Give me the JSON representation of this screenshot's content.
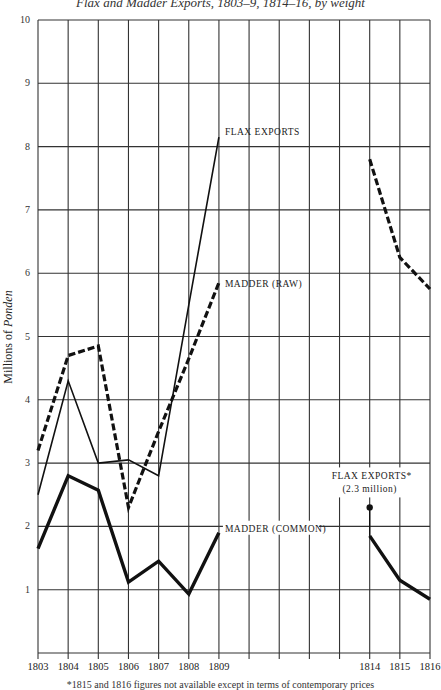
{
  "title": "Flax and Madder Exports, 1803–9, 1814–16, by weight",
  "footnote": "*1815 and 1816 figures not available except in terms of contemporary prices",
  "chart_data": {
    "type": "line",
    "title": "Flax and Madder Exports, 1803–9, 1814–16, by weight",
    "xlabel": "",
    "ylabel": "Millions of Ponden",
    "ylim": [
      0,
      10
    ],
    "yticks": [
      1,
      2,
      3,
      4,
      5,
      6,
      7,
      8,
      9,
      10
    ],
    "grid": true,
    "columns": [
      "1803",
      "1804",
      "1805",
      "1806",
      "1807",
      "1808",
      "1809",
      "",
      "",
      "",
      "",
      "1814",
      "1815",
      "1816"
    ],
    "x_labels": [
      "1803",
      "1804",
      "1805",
      "1806",
      "1807",
      "1808",
      "1809",
      "1814",
      "1815",
      "1816"
    ],
    "series": [
      {
        "name": "FLAX EXPORTS",
        "style": "thin-solid",
        "points": [
          {
            "x": "1803",
            "y": 2.5
          },
          {
            "x": "1804",
            "y": 4.3
          },
          {
            "x": "1805",
            "y": 3.0
          },
          {
            "x": "1806",
            "y": 3.05
          },
          {
            "x": "1807",
            "y": 2.8
          },
          {
            "x": "1808",
            "y": 5.5
          },
          {
            "x": "1809",
            "y": 8.15
          }
        ]
      },
      {
        "name": "MADDER (RAW)",
        "style": "thick-dashed",
        "points": [
          {
            "x": "1803",
            "y": 3.2
          },
          {
            "x": "1804",
            "y": 4.7
          },
          {
            "x": "1805",
            "y": 4.85
          },
          {
            "x": "1806",
            "y": 2.3
          },
          {
            "x": "1807",
            "y": 3.5
          },
          {
            "x": "1808",
            "y": 4.65
          },
          {
            "x": "1809",
            "y": 5.85
          },
          {
            "x": "1814",
            "y": 7.8,
            "break_before": true
          },
          {
            "x": "1815",
            "y": 6.25
          },
          {
            "x": "1816",
            "y": 5.75
          }
        ]
      },
      {
        "name": "MADDER (COMMON)",
        "style": "thick-solid",
        "points": [
          {
            "x": "1803",
            "y": 1.65
          },
          {
            "x": "1804",
            "y": 2.8
          },
          {
            "x": "1805",
            "y": 2.57
          },
          {
            "x": "1806",
            "y": 1.12
          },
          {
            "x": "1807",
            "y": 1.45
          },
          {
            "x": "1808",
            "y": 0.93
          },
          {
            "x": "1809",
            "y": 1.9
          },
          {
            "x": "1814",
            "y": 1.85,
            "break_before": true
          },
          {
            "x": "1815",
            "y": 1.15
          },
          {
            "x": "1816",
            "y": 0.85
          }
        ]
      }
    ],
    "annotations": [
      {
        "text": "FLAX EXPORTS",
        "attached_to": "FLAX EXPORTS",
        "at": "1809"
      },
      {
        "text": "MADDER (RAW)",
        "attached_to": "MADDER (RAW)",
        "at": "1809"
      },
      {
        "text": "MADDER (COMMON)",
        "attached_to": "MADDER (COMMON)",
        "at": "1809"
      },
      {
        "text": "FLAX EXPORTS*",
        "subtext": "(2.3 million)",
        "x": "1814",
        "y": 2.3,
        "marker": "dot"
      }
    ]
  },
  "labels": {
    "flax": "FLAX EXPORTS",
    "madder_raw": "MADDER (RAW)",
    "madder_common": "MADDER (COMMON)",
    "flax_1814": "FLAX EXPORTS*",
    "flax_1814_sub": "(2.3 million)"
  }
}
